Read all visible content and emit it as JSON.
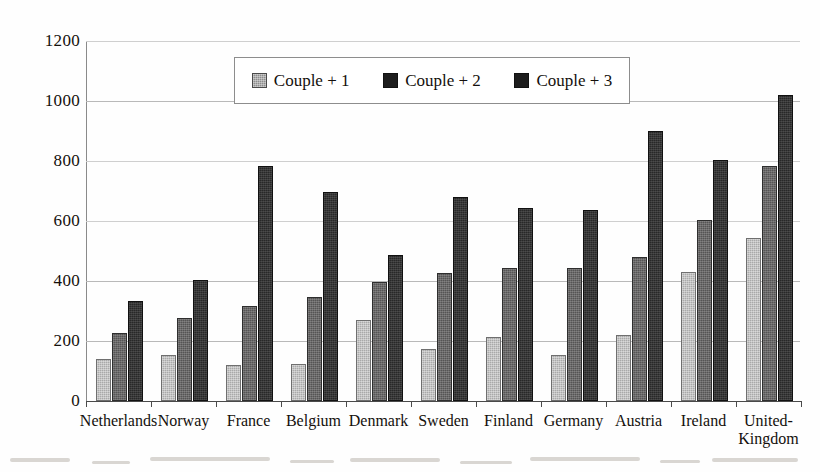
{
  "chart_data": {
    "type": "bar",
    "title": "",
    "xlabel": "",
    "ylabel": "",
    "ylim": [
      0,
      1200
    ],
    "yticks": [
      0,
      200,
      400,
      600,
      800,
      1000,
      1200
    ],
    "grid": true,
    "legend_position": "top-center",
    "categories": [
      "Netherlands",
      "Norway",
      "France",
      "Belgium",
      "Denmark",
      "Sweden",
      "Finland",
      "Germany",
      "Austria",
      "Ireland",
      "United-\nKingdom"
    ],
    "series": [
      {
        "name": "Couple + 1",
        "color": "#a9a9a9",
        "values": [
          140,
          155,
          120,
          125,
          270,
          172,
          215,
          152,
          220,
          430,
          545
        ]
      },
      {
        "name": "Couple + 2",
        "color": "#555454",
        "values": [
          228,
          278,
          318,
          348,
          398,
          428,
          443,
          445,
          480,
          605,
          785
        ]
      },
      {
        "name": "Couple + 3",
        "color": "#282828",
        "values": [
          335,
          403,
          783,
          697,
          487,
          680,
          645,
          637,
          900,
          805,
          1020
        ]
      }
    ]
  },
  "axis": {
    "ytick_labels": [
      "1200",
      "1000",
      "800",
      "600",
      "400",
      "200",
      "0"
    ]
  },
  "legend": {
    "items": [
      {
        "label": "Couple + 1",
        "swatch": "legend-swatch-couple-1"
      },
      {
        "label": "Couple + 2",
        "swatch": "legend-swatch-couple-2"
      },
      {
        "label": "Couple + 3",
        "swatch": "legend-swatch-couple-3"
      }
    ]
  }
}
